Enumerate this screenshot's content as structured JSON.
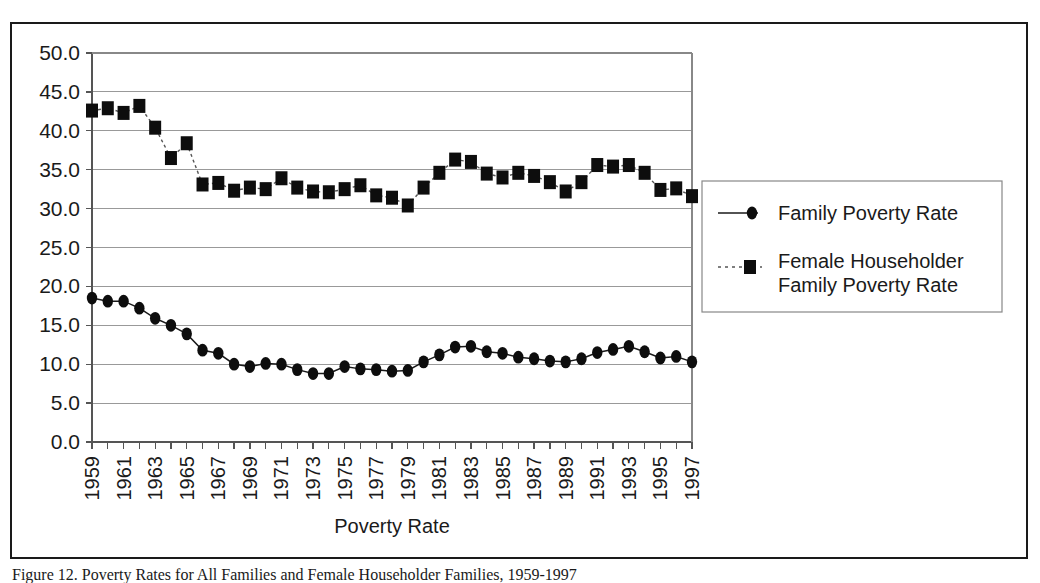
{
  "figure": {
    "caption": "Figure 12. Poverty Rates for All Families and Female Householder Families, 1959-1997"
  },
  "chart_data": {
    "type": "line",
    "title": "",
    "xlabel": "Poverty Rate",
    "ylabel": "",
    "ylim": [
      0.0,
      50.0
    ],
    "ytick_step": 5.0,
    "ytick_labels": [
      "50.0",
      "45.0",
      "40.0",
      "35.0",
      "30.0",
      "25.0",
      "20.0",
      "15.0",
      "10.0",
      "5.0",
      "0.0"
    ],
    "ytick_values": [
      50.0,
      45.0,
      40.0,
      35.0,
      30.0,
      25.0,
      20.0,
      15.0,
      10.0,
      5.0,
      0.0
    ],
    "grid": true,
    "legend_position": "right",
    "x": [
      1959,
      1960,
      1961,
      1962,
      1963,
      1964,
      1965,
      1966,
      1967,
      1968,
      1969,
      1970,
      1971,
      1972,
      1973,
      1974,
      1975,
      1976,
      1977,
      1978,
      1979,
      1980,
      1981,
      1982,
      1983,
      1984,
      1985,
      1986,
      1987,
      1988,
      1989,
      1990,
      1991,
      1992,
      1993,
      1994,
      1995,
      1996,
      1997
    ],
    "xtick_labels": [
      "1959",
      "1961",
      "1963",
      "1965",
      "1967",
      "1969",
      "1971",
      "1973",
      "1975",
      "1977",
      "1979",
      "1981",
      "1983",
      "1985",
      "1987",
      "1989",
      "1991",
      "1993",
      "1995",
      "1997"
    ],
    "xtick_label_values": [
      1959,
      1961,
      1963,
      1965,
      1967,
      1969,
      1971,
      1973,
      1975,
      1977,
      1979,
      1981,
      1983,
      1985,
      1987,
      1989,
      1991,
      1993,
      1995,
      1997
    ],
    "series": [
      {
        "name": "Family Poverty Rate",
        "marker": "circle",
        "linestyle": "solid",
        "color": "#0d0d0d",
        "values": [
          18.5,
          18.1,
          18.1,
          17.2,
          15.9,
          15.0,
          13.9,
          11.8,
          11.4,
          10.0,
          9.7,
          10.1,
          10.0,
          9.3,
          8.8,
          8.8,
          9.7,
          9.4,
          9.3,
          9.1,
          9.2,
          10.3,
          11.2,
          12.2,
          12.3,
          11.6,
          11.4,
          10.9,
          10.7,
          10.4,
          10.3,
          10.7,
          11.5,
          11.9,
          12.3,
          11.6,
          10.8,
          11.0,
          10.3
        ],
        "label_years": [
          1959,
          1960,
          1961,
          1962,
          1963,
          1964,
          1965,
          1966,
          1967,
          1968,
          1969,
          1970,
          1971,
          1972,
          1973,
          1974,
          1975,
          1976,
          1977,
          1978,
          1979,
          1980,
          1981,
          1982,
          1983,
          1984,
          1985,
          1986,
          1987,
          1988,
          1989,
          1990,
          1991,
          1992,
          1993,
          1994,
          1995,
          1996,
          1997
        ]
      },
      {
        "name": "Female  Householder Family Poverty Rate",
        "name_line1": "Female  Householder",
        "name_line2": "Family Poverty Rate",
        "marker": "square",
        "linestyle": "dotted",
        "color": "#0d0d0d",
        "values": [
          42.6,
          42.9,
          42.3,
          43.2,
          40.4,
          36.5,
          38.4,
          33.1,
          33.3,
          32.3,
          32.7,
          32.5,
          33.9,
          32.7,
          32.2,
          32.1,
          32.5,
          33.0,
          31.7,
          31.4,
          30.4,
          32.7,
          34.6,
          36.3,
          36.0,
          34.5,
          34.0,
          34.6,
          34.2,
          33.4,
          32.2,
          33.4,
          35.6,
          35.4,
          35.6,
          34.6,
          32.4,
          32.6,
          31.6
        ],
        "label_years": [
          1959,
          1960,
          1961,
          1962,
          1963,
          1964,
          1965,
          1966,
          1967,
          1968,
          1969,
          1970,
          1971,
          1972,
          1973,
          1974,
          1975,
          1976,
          1977,
          1978,
          1979,
          1980,
          1981,
          1982,
          1983,
          1984,
          1985,
          1986,
          1987,
          1988,
          1989,
          1990,
          1991,
          1992,
          1993,
          1994,
          1995,
          1996,
          1997
        ]
      }
    ]
  },
  "legend": {
    "entries": [
      {
        "label": "Family Poverty Rate"
      },
      {
        "label_line1": "Female  Householder",
        "label_line2": "Family Poverty Rate"
      }
    ]
  },
  "axis": {
    "x_title": "Poverty Rate"
  },
  "colors": {
    "ink": "#0d0d0d",
    "grid": "#999999",
    "frame": "#1a1a1a",
    "background": "#ffffff"
  }
}
